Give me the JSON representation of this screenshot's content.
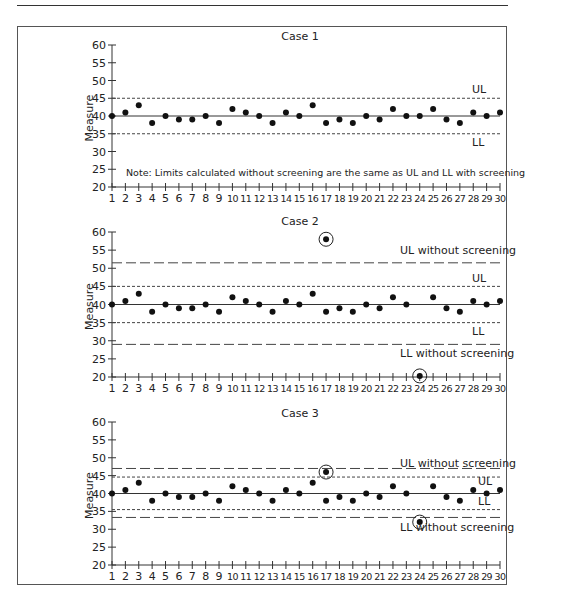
{
  "chart_data": [
    {
      "type": "scatter",
      "title": "Case 1",
      "xlabel": "",
      "ylabel": "Measure",
      "ylim": [
        20,
        60
      ],
      "yticks": [
        20,
        25,
        30,
        35,
        40,
        45,
        50,
        55,
        60
      ],
      "xticks": [
        1,
        2,
        3,
        4,
        5,
        6,
        7,
        8,
        9,
        10,
        11,
        12,
        13,
        14,
        15,
        16,
        17,
        18,
        19,
        20,
        21,
        22,
        23,
        24,
        25,
        26,
        27,
        28,
        29,
        30
      ],
      "center_line": 40,
      "limits": [
        {
          "name": "UL",
          "value": 45,
          "style": "short-dash"
        },
        {
          "name": "LL",
          "value": 35,
          "style": "short-dash"
        }
      ],
      "values": [
        40,
        41,
        43,
        38,
        40,
        39,
        39,
        40,
        38,
        42,
        41,
        40,
        38,
        41,
        40,
        43,
        38,
        39,
        38,
        40,
        39,
        42,
        40,
        40,
        42,
        39,
        38,
        41,
        40,
        41
      ],
      "outliers": [],
      "annotation": "Note: Limits calculated without screening are the same as UL and LL with screening"
    },
    {
      "type": "scatter",
      "title": "Case 2",
      "xlabel": "",
      "ylabel": "Measure",
      "ylim": [
        20,
        60
      ],
      "yticks": [
        20,
        25,
        30,
        35,
        40,
        45,
        50,
        55,
        60
      ],
      "xticks": [
        1,
        2,
        3,
        4,
        5,
        6,
        7,
        8,
        9,
        10,
        11,
        12,
        13,
        14,
        15,
        16,
        17,
        18,
        19,
        20,
        21,
        22,
        23,
        24,
        25,
        26,
        27,
        28,
        29,
        30
      ],
      "center_line": 40,
      "limits": [
        {
          "name": "UL without screening",
          "value": 51.5,
          "style": "long-dash"
        },
        {
          "name": "UL",
          "value": 45,
          "style": "short-dash"
        },
        {
          "name": "LL",
          "value": 35,
          "style": "short-dash"
        },
        {
          "name": "LL without screening",
          "value": 29,
          "style": "long-dash"
        }
      ],
      "values": [
        40,
        41,
        43,
        38,
        40,
        39,
        39,
        40,
        38,
        42,
        41,
        40,
        38,
        41,
        40,
        43,
        38,
        39,
        38,
        40,
        39,
        42,
        40,
        null,
        42,
        39,
        38,
        41,
        40,
        41
      ],
      "outliers": [
        {
          "x": 17,
          "y": 58
        },
        {
          "x": 24,
          "y": 20.3
        }
      ]
    },
    {
      "type": "scatter",
      "title": "Case 3",
      "xlabel": "",
      "ylabel": "Measure",
      "ylim": [
        20,
        60
      ],
      "yticks": [
        20,
        25,
        30,
        35,
        40,
        45,
        50,
        55,
        60
      ],
      "xticks": [
        1,
        2,
        3,
        4,
        5,
        6,
        7,
        8,
        9,
        10,
        11,
        12,
        13,
        14,
        15,
        16,
        17,
        18,
        19,
        20,
        21,
        22,
        23,
        24,
        25,
        26,
        27,
        28,
        29,
        30
      ],
      "center_line": 40,
      "limits": [
        {
          "name": "UL without screening",
          "value": 47,
          "style": "long-dash"
        },
        {
          "name": "UL",
          "value": 44.6,
          "style": "short-dash"
        },
        {
          "name": "LL",
          "value": 35.5,
          "style": "short-dash"
        },
        {
          "name": "LL without screening",
          "value": 33.3,
          "style": "long-dash"
        }
      ],
      "values": [
        40,
        41,
        43,
        38,
        40,
        39,
        39,
        40,
        38,
        42,
        41,
        40,
        38,
        41,
        40,
        43,
        38,
        39,
        38,
        40,
        39,
        42,
        40,
        null,
        42,
        39,
        38,
        41,
        40,
        41
      ],
      "outliers": [
        {
          "x": 17,
          "y": 46
        },
        {
          "x": 24,
          "y": 32
        }
      ]
    }
  ],
  "layout": {
    "panels": [
      {
        "top": 45,
        "bottom": 187,
        "labels": {
          "UL": [
            472,
            93
          ],
          "LL": [
            472,
            146
          ]
        },
        "title_y": 40,
        "note_y": 176
      },
      {
        "top": 232,
        "bottom": 377,
        "labels": {
          "UL without screening": [
            400,
            254
          ],
          "UL": [
            472,
            282
          ],
          "LL": [
            472,
            335
          ],
          "LL without screening": [
            400,
            357
          ]
        },
        "title_y": 225
      },
      {
        "top": 422,
        "bottom": 565,
        "labels": {
          "UL without screening": [
            400,
            467
          ],
          "UL": [
            478,
            485
          ],
          "LL": [
            478,
            505
          ],
          "LL without screening": [
            400,
            531
          ]
        },
        "title_y": 417
      }
    ]
  }
}
